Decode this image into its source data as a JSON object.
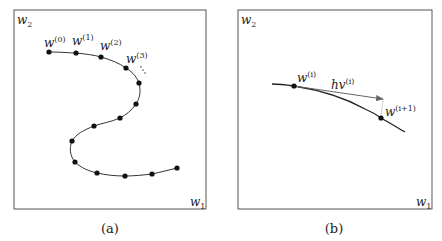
{
  "panels": [
    {
      "id": "a",
      "caption": "(a)",
      "y_axis_label": "w",
      "y_axis_sub": "2",
      "x_axis_label": "w",
      "x_axis_sub": "1",
      "point_labels": [
        {
          "base": "w",
          "sup": "(0)"
        },
        {
          "base": "w",
          "sup": "(1)"
        },
        {
          "base": "w",
          "sup": "(2)"
        },
        {
          "base": "w",
          "sup": "(3)"
        }
      ],
      "ellipsis": "..."
    },
    {
      "id": "b",
      "caption": "(b)",
      "y_axis_label": "w",
      "y_axis_sub": "2",
      "x_axis_label": "w",
      "x_axis_sub": "1",
      "point_labels": [
        {
          "base": "w",
          "sup": "(i)"
        },
        {
          "base": "w",
          "sup": "(i+1)"
        }
      ],
      "arrow_label": {
        "base": "hv",
        "sup": "(i)"
      }
    }
  ],
  "colors": {
    "frame": "#555555",
    "curve": "#333333",
    "point": "#111111",
    "arrow": "#666666",
    "dotted": "#888888"
  }
}
